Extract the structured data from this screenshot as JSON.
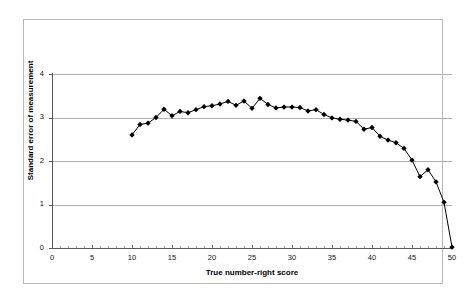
{
  "chart_data": {
    "type": "line",
    "title": "",
    "xlabel": "True number-right score",
    "ylabel": "Standard error of measurement",
    "xlim": [
      0,
      50
    ],
    "ylim": [
      0,
      4
    ],
    "xticks": [
      0,
      5,
      10,
      15,
      20,
      25,
      30,
      35,
      40,
      45,
      50
    ],
    "yticks": [
      0,
      1,
      2,
      3,
      4
    ],
    "xtick_labels": [
      "0",
      "5",
      "10",
      "15",
      "20",
      "25",
      "30",
      "35",
      "40",
      "45",
      "50"
    ],
    "ytick_labels": [
      "0",
      "1",
      "2",
      "3",
      "4"
    ],
    "grid": "horizontal",
    "legend": "none",
    "marker": "filled-diamond",
    "line_color": "#000000",
    "marker_color": "#000000",
    "series": [
      {
        "name": "Standard error of measurement",
        "x": [
          10,
          11,
          12,
          13,
          14,
          15,
          16,
          17,
          18,
          19,
          20,
          21,
          22,
          23,
          24,
          25,
          26,
          27,
          28,
          29,
          30,
          31,
          32,
          33,
          34,
          35,
          36,
          37,
          38,
          39,
          40,
          41,
          42,
          43,
          44,
          45,
          46,
          47,
          48,
          49,
          50
        ],
        "y": [
          2.6,
          2.84,
          2.87,
          3.0,
          3.19,
          3.04,
          3.14,
          3.11,
          3.18,
          3.25,
          3.27,
          3.31,
          3.37,
          3.28,
          3.38,
          3.21,
          3.44,
          3.3,
          3.22,
          3.24,
          3.24,
          3.23,
          3.15,
          3.18,
          3.07,
          2.99,
          2.96,
          2.94,
          2.91,
          2.73,
          2.77,
          2.57,
          2.48,
          2.42,
          2.29,
          2.02,
          1.64,
          1.8,
          1.52,
          1.05,
          0.02
        ]
      }
    ]
  },
  "axes": {
    "y_title": "Standard error of measurement",
    "x_title": "True number-right score"
  }
}
